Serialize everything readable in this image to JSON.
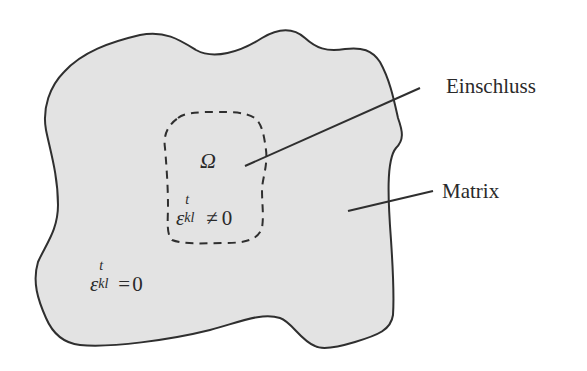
{
  "figure": {
    "type": "diagram",
    "colors": {
      "matrix_fill": "#e3e3e3",
      "outline": "#2f2f2f",
      "text": "#2a2a2a",
      "background": "#ffffff"
    },
    "labels": {
      "inclusion_label": "Einschluss",
      "matrix_label": "Matrix",
      "omega_symbol": "Ω",
      "inclusion_strain": {
        "symbol": "ε",
        "superscript": "t",
        "subscript": "kl",
        "relation": "≠",
        "value": "0"
      },
      "matrix_strain": {
        "symbol": "ε",
        "superscript": "t",
        "subscript": "kl",
        "relation": "=",
        "value": "0"
      }
    },
    "regions": [
      {
        "name": "Matrix",
        "outline": "solid",
        "fill": "gray"
      },
      {
        "name": "Einschluss (Ω)",
        "outline": "dashed",
        "fill": "none"
      }
    ],
    "leader_lines": [
      {
        "target": "Einschluss",
        "from": [
          245,
          166
        ],
        "to": [
          420,
          88
        ]
      },
      {
        "target": "Matrix",
        "from": [
          348,
          211
        ],
        "to": [
          433,
          191
        ]
      }
    ]
  }
}
